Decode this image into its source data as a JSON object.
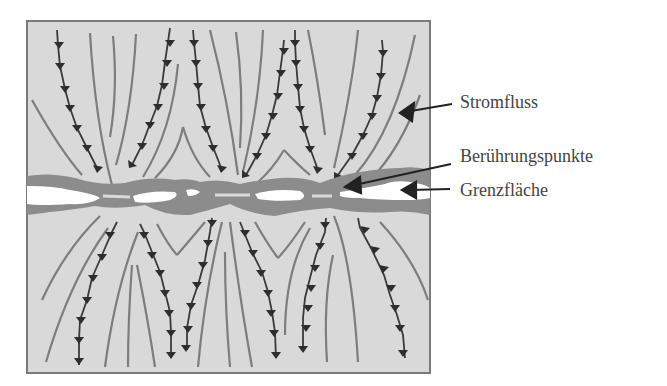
{
  "diagram": {
    "labels": {
      "current_flow": "Stromfluss",
      "contact_points": "Berührungspunkte",
      "interface": "Grenzfläche"
    },
    "colors": {
      "background": "#ffffff",
      "material_fill": "#d9d9d9",
      "border": "#7a7a7a",
      "field_line": "#7d7d7d",
      "arrow_line": "#3a3a3a",
      "interface_band": "#8c8c8c",
      "gap": "#ffffff",
      "text": "#444444"
    }
  }
}
